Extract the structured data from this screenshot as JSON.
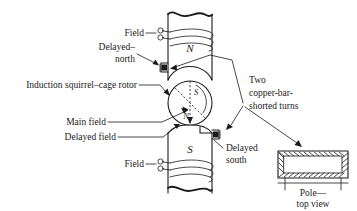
{
  "figure": {
    "background_color": "#ffffff",
    "ink_color": "#1a1a1a",
    "labels": {
      "field_top": "Field",
      "field_bottom": "Field",
      "delayed_north_line1": "Delayed–",
      "delayed_north_line2": "north",
      "induction_rotor": "Induction squirrel–cage rotor",
      "main_field": "Main field",
      "delayed_field": "Delayed field",
      "delayed_south_line1": "Delayed",
      "delayed_south_line2": "south",
      "copper_bar_line1": "Two",
      "copper_bar_line2": "copper-bar-",
      "copper_bar_line3": "shorted turns",
      "pole_top_view_line1": "Pole—",
      "pole_top_view_line2": "top view"
    },
    "pole_markers": {
      "upper_pole": "N",
      "lower_pole": "S"
    },
    "rotor_markers": {
      "upper_right": "S",
      "lower_left": "N"
    }
  }
}
